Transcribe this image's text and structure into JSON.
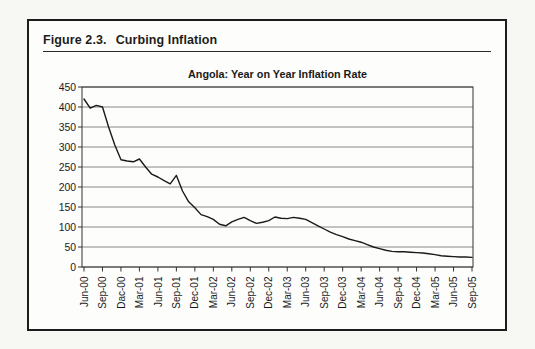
{
  "figure": {
    "label": "Figure 2.3.",
    "title": "Curbing Inflation"
  },
  "chart_data": {
    "type": "line",
    "title": "Angola: Year on Year Inflation Rate",
    "series_name": "Angola year-on-year inflation rate (percent)",
    "x_start": "Jun-00",
    "x_end": "Sep-05",
    "x_frequency": "monthly",
    "x_tick_interval_months": 3,
    "x_tick_labels": [
      "Jun-00",
      "Sep-00",
      "Dac-00",
      "Mar-01",
      "Jun-01",
      "Sep-01",
      "Dec-01",
      "Mar-02",
      "Jun-02",
      "Sep-02",
      "Dec-02",
      "Mar-03",
      "Jun-03",
      "Sep-03",
      "Dec-03",
      "Mar-04",
      "Jun-04",
      "Sep-04",
      "Dec-04",
      "Mar-05",
      "Jun-05",
      "Sep-05"
    ],
    "values": [
      420,
      397,
      404,
      400,
      350,
      305,
      268,
      265,
      263,
      270,
      250,
      232,
      225,
      216,
      208,
      229,
      190,
      163,
      148,
      131,
      126,
      119,
      107,
      103,
      113,
      119,
      124,
      116,
      109,
      112,
      116,
      125,
      122,
      121,
      124,
      122,
      119,
      111,
      103,
      95,
      87,
      81,
      76,
      70,
      66,
      62,
      56,
      50,
      46,
      42,
      39,
      38,
      38,
      37,
      36,
      35,
      33,
      31,
      28,
      27,
      26,
      25,
      25,
      24
    ],
    "ylim": [
      0,
      450
    ],
    "y_ticks": [
      0,
      50,
      100,
      150,
      200,
      250,
      300,
      350,
      400,
      450
    ],
    "grid": "horizontal",
    "legend": "none",
    "line_color": "#1a1a1a",
    "axis_color": "#333333",
    "grid_color": "#4a4a4a",
    "text_color": "#1a1a1a"
  }
}
